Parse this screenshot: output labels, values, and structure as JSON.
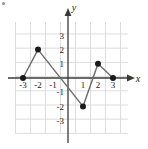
{
  "figure": {
    "background_color": "#ffffff",
    "corner_mark": "bullet-artifact"
  },
  "chart_data": {
    "type": "line",
    "title": "",
    "subtitle": "",
    "xlabel": "x",
    "ylabel": "y",
    "xlim": [
      -4,
      4
    ],
    "ylim": [
      -3.5,
      3.5
    ],
    "grid": true,
    "grid_color": "#d9d9d9",
    "grid_step": 1,
    "axis_color": "#3a3a3a",
    "line_color": "#6b6b6b",
    "marker_color": "#1a1a1a",
    "marker_style": "filled-circle",
    "legend": false,
    "x_ticks": [
      -3,
      -2,
      -1,
      1,
      2,
      3
    ],
    "x_tick_labels": [
      "-3",
      "-2",
      "-1",
      "1",
      "2",
      "3"
    ],
    "y_ticks": [
      3,
      2,
      1,
      -1,
      -2,
      -3
    ],
    "y_tick_labels": [
      "3",
      "2",
      "1",
      "-1",
      "-2",
      "-3"
    ],
    "x": [
      -3,
      -2,
      1,
      2,
      3
    ],
    "values": [
      0,
      2,
      -2,
      1,
      0
    ],
    "points": [
      {
        "x": -3,
        "y": 0
      },
      {
        "x": -2,
        "y": 2
      },
      {
        "x": 1,
        "y": -2
      },
      {
        "x": 2,
        "y": 1
      },
      {
        "x": 3,
        "y": 0
      }
    ],
    "x_axis_arrow": "right",
    "y_axis_arrow": "up"
  }
}
